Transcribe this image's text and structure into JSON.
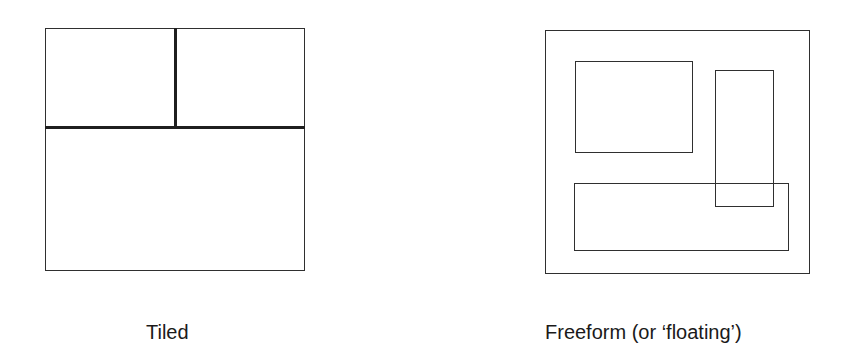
{
  "diagrams": [
    {
      "id": "tiled",
      "caption": "Tiled",
      "outer": {
        "x": 45,
        "y": 28,
        "w": 260,
        "h": 243
      },
      "panes": [
        {
          "name": "top-left-pane",
          "x": 45,
          "y": 28,
          "w": 131,
          "h": 100
        },
        {
          "name": "top-right-pane",
          "x": 175,
          "y": 28,
          "w": 130,
          "h": 100
        },
        {
          "name": "bottom-pane",
          "x": 45,
          "y": 127,
          "w": 260,
          "h": 144
        }
      ]
    },
    {
      "id": "freeform",
      "caption": "Freeform (or ‘floating’)",
      "outer": {
        "x": 545,
        "y": 30,
        "w": 265,
        "h": 244
      },
      "windows": [
        {
          "name": "window-top-left",
          "x": 575,
          "y": 61,
          "w": 118,
          "h": 92
        },
        {
          "name": "window-tall-right",
          "x": 715,
          "y": 70,
          "w": 59,
          "h": 137
        },
        {
          "name": "window-wide-bottom",
          "x": 574,
          "y": 183,
          "w": 215,
          "h": 68
        }
      ]
    }
  ],
  "colors": {
    "stroke": "#2f2f2f",
    "background": "#ffffff",
    "text": "#1a1a1a"
  }
}
